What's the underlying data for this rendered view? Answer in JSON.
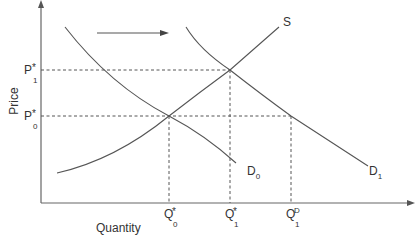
{
  "diagram": {
    "type": "supply-demand",
    "axes": {
      "y_label": "Price",
      "x_label": "Quantity"
    },
    "curves": {
      "supply": {
        "label": "S"
      },
      "demand_0": {
        "label": "D",
        "subscript": "0"
      },
      "demand_1": {
        "label": "D",
        "subscript": "1"
      }
    },
    "price_levels": [
      {
        "label": "P",
        "sup": "*",
        "sub": "1"
      },
      {
        "label": "P",
        "sup": "*",
        "sub": "0"
      }
    ],
    "quantity_levels": [
      {
        "label": "Q",
        "sup": "*",
        "sub": "0"
      },
      {
        "label": "Q",
        "sup": "*",
        "sub": "1"
      },
      {
        "label": "Q",
        "sup": "D",
        "sub": "1"
      }
    ],
    "shift_arrow": {
      "direction": "right"
    },
    "colors": {
      "line": "#555555",
      "text": "#333333",
      "background": "#ffffff"
    }
  }
}
